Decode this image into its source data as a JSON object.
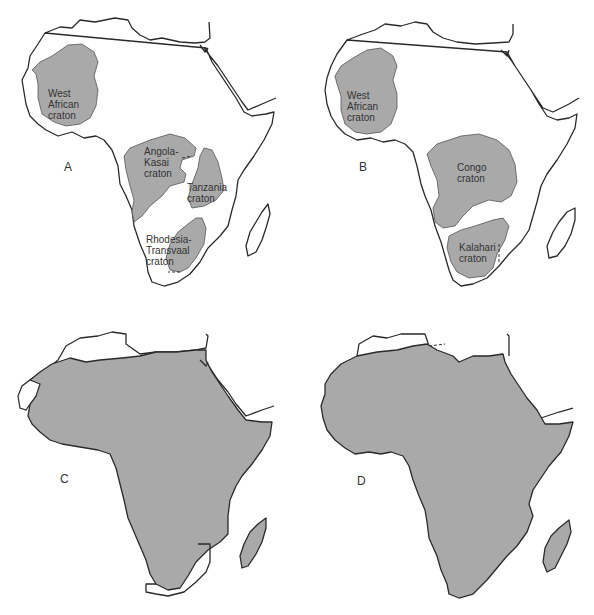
{
  "figure": {
    "panels": [
      {
        "letter": "A",
        "cratons": [
          {
            "name": "West African craton",
            "label_lines": [
              "West",
              "African",
              "craton"
            ]
          },
          {
            "name": "Angola-Kasai craton",
            "label_lines": [
              "Angola-",
              "Kasai",
              "craton"
            ]
          },
          {
            "name": "Tanzania craton",
            "label_lines": [
              "Tanzania",
              "craton"
            ]
          },
          {
            "name": "Rhodesia-Transvaal craton",
            "label_lines": [
              "Rhodesia-",
              "Transvaal",
              "craton"
            ]
          }
        ]
      },
      {
        "letter": "B",
        "cratons": [
          {
            "name": "West African craton",
            "label_lines": [
              "West",
              "African",
              "craton"
            ]
          },
          {
            "name": "Congo craton",
            "label_lines": [
              "Congo",
              "craton"
            ]
          },
          {
            "name": "Kalahari craton",
            "label_lines": [
              "Kalahari",
              "craton"
            ]
          }
        ]
      },
      {
        "letter": "C",
        "cratons": []
      },
      {
        "letter": "D",
        "cratons": []
      }
    ]
  },
  "labels": {
    "A": {
      "letter": "A",
      "west_african": "West\nAfrican\ncraton",
      "angola_kasai": "Angola-\nKasai\ncraton",
      "tanzania": "Tanzania\ncraton",
      "rhodesia_transvaal": "Rhodesia-\nTransvaal\ncraton"
    },
    "B": {
      "letter": "B",
      "west_african": "West\nAfrican\ncraton",
      "congo": "Congo\ncraton",
      "kalahari": "Kalahari\ncraton"
    },
    "C": {
      "letter": "C"
    },
    "D": {
      "letter": "D"
    }
  },
  "colors": {
    "craton_fill": "#a9a9a9",
    "coastline": "#2a2a2a",
    "background": "#ffffff"
  }
}
